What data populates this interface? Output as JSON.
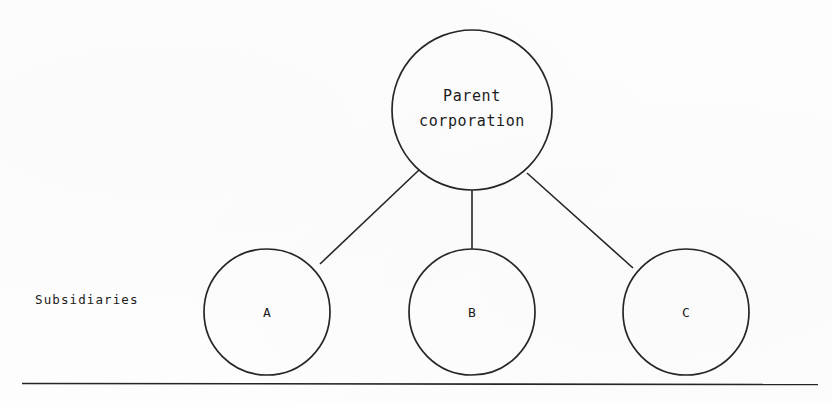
{
  "diagram": {
    "type": "organizational-hierarchy",
    "orientation": "top-down",
    "background_color": "#fdfdfd",
    "stroke_color": "#262626",
    "side_label": "Subsidiaries",
    "parent": {
      "id": "parent",
      "label_line1": "Parent",
      "label_line2": "corporation",
      "shape": "circle",
      "cx": 472,
      "cy": 110,
      "r": 80
    },
    "children": [
      {
        "id": "a",
        "label": "A",
        "shape": "circle",
        "cx": 267,
        "cy": 312,
        "r": 63
      },
      {
        "id": "b",
        "label": "B",
        "shape": "circle",
        "cx": 472,
        "cy": 312,
        "r": 63
      },
      {
        "id": "c",
        "label": "C",
        "shape": "circle",
        "cx": 686,
        "cy": 312,
        "r": 63
      }
    ],
    "edges": [
      {
        "from": "parent",
        "to": "a",
        "x1": 419,
        "y1": 170,
        "x2": 320,
        "y2": 264
      },
      {
        "from": "parent",
        "to": "b",
        "x1": 472,
        "y1": 190,
        "x2": 472,
        "y2": 249
      },
      {
        "from": "parent",
        "to": "c",
        "x1": 527,
        "y1": 173,
        "x2": 633,
        "y2": 268
      }
    ],
    "footer_rule": {
      "x1": 22,
      "y1": 383,
      "x2": 818,
      "y2": 384
    }
  }
}
